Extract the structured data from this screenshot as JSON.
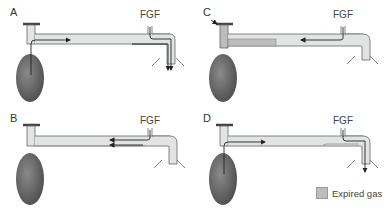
{
  "panels": [
    {
      "label": "A",
      "fgf": "FGF"
    },
    {
      "label": "B",
      "fgf": "FGF"
    },
    {
      "label": "C",
      "fgf": "FGF"
    },
    {
      "label": "D",
      "fgf": "FGF"
    }
  ],
  "legend": {
    "label": "Expired gas",
    "color": "#bdbdbd"
  },
  "colors": {
    "tube": "#e2e4e4",
    "tube_outline": "#555555",
    "bag": "#6e6e6e",
    "expired_gas": "#bdbdbd",
    "arrow": "#222222"
  }
}
